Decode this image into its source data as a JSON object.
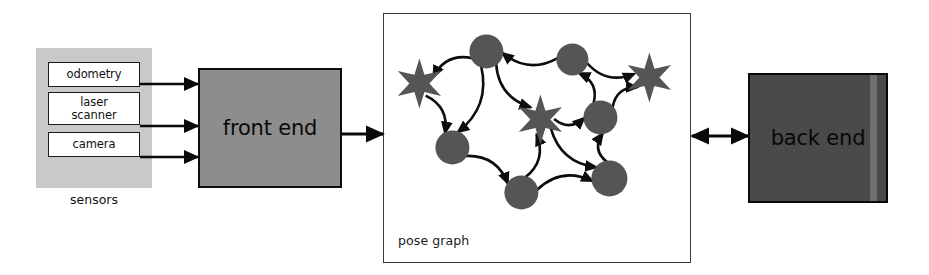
{
  "diagram": {
    "colors": {
      "sensor_panel_fill": "#c9c9c9",
      "sensor_box_fill": "#ffffff",
      "front_end_fill": "#8d8d8d",
      "back_end_fill": "#4a4a4a",
      "back_end_stripe": "#6f6f6f",
      "node_fill": "#555555",
      "edge_stroke": "#0d0d0d",
      "panel_border": "#3a3a3a",
      "text": "#111111"
    }
  },
  "sensors": {
    "caption": "sensors",
    "items": [
      {
        "label": "odometry"
      },
      {
        "label": "laser\nscanner"
      },
      {
        "label": "camera"
      }
    ]
  },
  "front_end": {
    "label": "front end"
  },
  "pose_graph": {
    "caption": "pose  graph",
    "nodes": [
      {
        "id": "p1",
        "type": "circle",
        "x": 487,
        "y": 52,
        "r": 17
      },
      {
        "id": "p2",
        "type": "circle",
        "x": 573,
        "y": 60,
        "r": 16
      },
      {
        "id": "p3",
        "type": "circle",
        "x": 601,
        "y": 118,
        "r": 17
      },
      {
        "id": "p4",
        "type": "circle",
        "x": 453,
        "y": 148,
        "r": 17
      },
      {
        "id": "p5",
        "type": "circle",
        "x": 522,
        "y": 193,
        "r": 17
      },
      {
        "id": "p6",
        "type": "circle",
        "x": 610,
        "y": 179,
        "r": 18
      },
      {
        "id": "l1",
        "type": "star",
        "x": 420,
        "y": 84,
        "r": 25
      },
      {
        "id": "l2",
        "type": "star",
        "x": 650,
        "y": 78,
        "r": 25
      },
      {
        "id": "l3",
        "type": "star",
        "x": 541,
        "y": 120,
        "r": 25
      }
    ],
    "edges": [
      {
        "from": "l1",
        "to": "p1",
        "reverse": true
      },
      {
        "from": "p1",
        "to": "p2",
        "reverse": true
      },
      {
        "from": "p2",
        "to": "l2"
      },
      {
        "from": "p1",
        "to": "p4"
      },
      {
        "from": "p1",
        "to": "l3"
      },
      {
        "from": "l1",
        "to": "p4"
      },
      {
        "from": "p3",
        "to": "p2"
      },
      {
        "from": "p3",
        "to": "l2"
      },
      {
        "from": "l3",
        "to": "p3"
      },
      {
        "from": "p4",
        "to": "p5"
      },
      {
        "from": "p5",
        "to": "l3"
      },
      {
        "from": "p5",
        "to": "p6"
      },
      {
        "from": "l3",
        "to": "p6"
      },
      {
        "from": "p6",
        "to": "p3"
      }
    ]
  },
  "back_end": {
    "label": "back  end"
  },
  "connections": [
    {
      "name": "odometry-to-front-end",
      "direction": "one-way"
    },
    {
      "name": "laser-scanner-to-front-end",
      "direction": "one-way"
    },
    {
      "name": "camera-to-front-end",
      "direction": "one-way"
    },
    {
      "name": "front-end-to-pose-graph",
      "direction": "one-way"
    },
    {
      "name": "pose-graph-to-back-end",
      "direction": "two-way"
    }
  ]
}
